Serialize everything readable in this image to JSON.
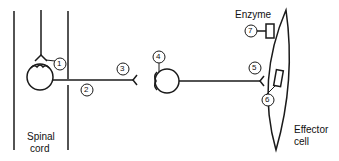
{
  "diagram": {
    "labels": {
      "spinal_cord_line1": "Spinal",
      "spinal_cord_line2": "cord",
      "effector_line1": "Effector",
      "effector_line2": "cell",
      "enzyme": "Enzyme"
    },
    "markers": [
      "1",
      "2",
      "3",
      "4",
      "5",
      "6",
      "7"
    ],
    "colors": {
      "stroke": "#1a1a1a",
      "background": "#ffffff"
    }
  }
}
